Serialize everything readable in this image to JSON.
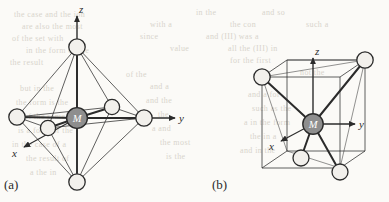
{
  "figure": {
    "background_color": "#fbfaf7",
    "ink_color": "#2b2b2b",
    "sphere_fill": "#f2f0ec",
    "center_fill": "#8e8e8e",
    "bleed_color": "#d8d4cc"
  },
  "panels": [
    {
      "id": "a",
      "caption": "(a)",
      "geometry": "octahedral",
      "center_label": "M",
      "ligand_count": 6,
      "axes": [
        {
          "name": "z",
          "label": "z",
          "direction": "up"
        },
        {
          "name": "y",
          "label": "y",
          "direction": "right"
        },
        {
          "name": "x",
          "label": "x",
          "direction": "lower-left"
        }
      ]
    },
    {
      "id": "b",
      "caption": "(b)",
      "geometry": "tetrahedral-in-cube",
      "center_label": "M",
      "ligand_count": 4,
      "axes": [
        {
          "name": "z",
          "label": "z",
          "direction": "up"
        },
        {
          "name": "y",
          "label": "y",
          "direction": "right"
        },
        {
          "name": "x",
          "label": "x",
          "direction": "lower-left"
        }
      ]
    }
  ],
  "bleed_through_text": [
    {
      "text": "the case and the ion",
      "x": 14,
      "y": 10
    },
    {
      "text": "in the",
      "x": 196,
      "y": 8
    },
    {
      "text": "and so",
      "x": 262,
      "y": 8
    },
    {
      "text": "are also the most",
      "x": 22,
      "y": 22
    },
    {
      "text": "with a",
      "x": 150,
      "y": 20
    },
    {
      "text": "the con",
      "x": 230,
      "y": 20
    },
    {
      "text": "such a",
      "x": 306,
      "y": 20
    },
    {
      "text": "of the set with",
      "x": 12,
      "y": 34
    },
    {
      "text": "since",
      "x": 140,
      "y": 32
    },
    {
      "text": "and (III) was a",
      "x": 206,
      "y": 32
    },
    {
      "text": "in the form of the",
      "x": 26,
      "y": 46
    },
    {
      "text": "value",
      "x": 170,
      "y": 44
    },
    {
      "text": "all the (III) in",
      "x": 228,
      "y": 44
    },
    {
      "text": "the result",
      "x": 10,
      "y": 58
    },
    {
      "text": "for the first",
      "x": 230,
      "y": 56
    },
    {
      "text": "of the",
      "x": 126,
      "y": 70
    },
    {
      "text": "not the",
      "x": 300,
      "y": 68
    },
    {
      "text": "but in the",
      "x": 20,
      "y": 84
    },
    {
      "text": "and a",
      "x": 150,
      "y": 82
    },
    {
      "text": "the form is the",
      "x": 16,
      "y": 98
    },
    {
      "text": "and the",
      "x": 146,
      "y": 96
    },
    {
      "text": "of the same",
      "x": 24,
      "y": 112
    },
    {
      "text": "the",
      "x": 158,
      "y": 110
    },
    {
      "text": "is a form of the",
      "x": 18,
      "y": 126
    },
    {
      "text": "a and",
      "x": 152,
      "y": 124
    },
    {
      "text": "in the case of a",
      "x": 12,
      "y": 140
    },
    {
      "text": "the most",
      "x": 160,
      "y": 138
    },
    {
      "text": "the result of",
      "x": 26,
      "y": 154
    },
    {
      "text": "is the",
      "x": 166,
      "y": 152
    },
    {
      "text": "a the in",
      "x": 30,
      "y": 168
    },
    {
      "text": "and a for",
      "x": 248,
      "y": 90
    },
    {
      "text": "such as the",
      "x": 252,
      "y": 104
    },
    {
      "text": "a in the form",
      "x": 244,
      "y": 118
    },
    {
      "text": "the in a",
      "x": 250,
      "y": 132
    },
    {
      "text": "and in the",
      "x": 240,
      "y": 146
    }
  ]
}
